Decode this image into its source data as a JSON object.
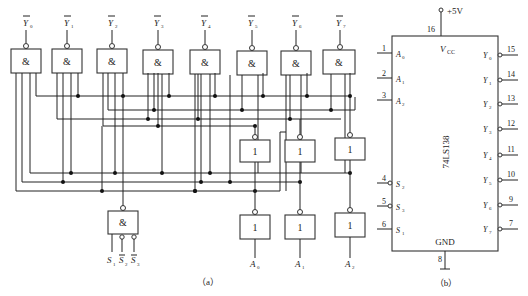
{
  "figure_a": {
    "caption": "（a）",
    "and_gate_symbol": "&",
    "not_gate_symbol": "1",
    "outputs": [
      {
        "name": "Y",
        "sub": "0"
      },
      {
        "name": "Y",
        "sub": "1"
      },
      {
        "name": "Y",
        "sub": "2"
      },
      {
        "name": "Y",
        "sub": "3"
      },
      {
        "name": "Y",
        "sub": "4"
      },
      {
        "name": "Y",
        "sub": "5"
      },
      {
        "name": "Y",
        "sub": "6"
      },
      {
        "name": "Y",
        "sub": "7"
      }
    ],
    "address_inputs": [
      {
        "name": "A",
        "sub": "0"
      },
      {
        "name": "A",
        "sub": "1"
      },
      {
        "name": "A",
        "sub": "2"
      }
    ],
    "enable_inputs": [
      {
        "name": "S",
        "sub": "1",
        "inverted": false
      },
      {
        "name": "S",
        "sub": "2",
        "inverted": true
      },
      {
        "name": "S",
        "sub": "3",
        "inverted": true
      }
    ]
  },
  "figure_b": {
    "caption": "（b）",
    "chip_name": "74LS138",
    "power_label": "+5V",
    "vcc_label": "V",
    "vcc_sub": "CC",
    "gnd_label": "GND",
    "vcc_pin": "16",
    "gnd_pin": "8",
    "left_pins": [
      {
        "pin": "1",
        "name": "A",
        "sub": "0",
        "inverted": false
      },
      {
        "pin": "2",
        "name": "A",
        "sub": "1",
        "inverted": false
      },
      {
        "pin": "3",
        "name": "A",
        "sub": "2",
        "inverted": false
      },
      {
        "pin": "4",
        "name": "S",
        "sub": "2",
        "inverted": true
      },
      {
        "pin": "5",
        "name": "S",
        "sub": "3",
        "inverted": true
      },
      {
        "pin": "6",
        "name": "S",
        "sub": "1",
        "inverted": false
      }
    ],
    "right_pins": [
      {
        "pin": "15",
        "name": "Y",
        "sub": "0"
      },
      {
        "pin": "14",
        "name": "Y",
        "sub": "1"
      },
      {
        "pin": "13",
        "name": "Y",
        "sub": "2"
      },
      {
        "pin": "12",
        "name": "Y",
        "sub": "3"
      },
      {
        "pin": "11",
        "name": "Y",
        "sub": "4"
      },
      {
        "pin": "10",
        "name": "Y",
        "sub": "5"
      },
      {
        "pin": "9",
        "name": "Y",
        "sub": "6"
      },
      {
        "pin": "7",
        "name": "Y",
        "sub": "7"
      }
    ]
  }
}
